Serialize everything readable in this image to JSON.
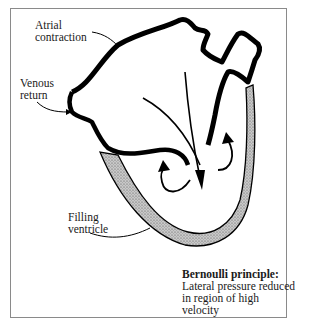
{
  "diagram": {
    "labels": {
      "atrial_contraction": [
        "Atrial",
        "contraction"
      ],
      "venous_return": [
        "Venous",
        "return"
      ],
      "filling_ventricle": [
        "Filling",
        "ventricle"
      ]
    },
    "caption": {
      "title": "Bernoulli principle:",
      "line1": "Lateral pressure reduced",
      "line2": "in region of high velocity"
    },
    "colors": {
      "outline": "#000000",
      "wall_fill": "#b5b5b5",
      "frame": "#8a8a8a"
    }
  }
}
